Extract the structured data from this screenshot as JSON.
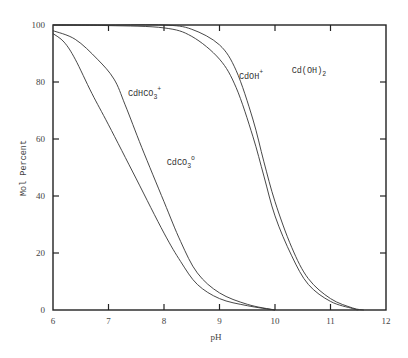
{
  "chart_data": {
    "type": "line",
    "title": "",
    "xlabel": "pH",
    "ylabel": "Mol Percent",
    "xlim": [
      6,
      12
    ],
    "ylim": [
      0,
      100
    ],
    "x_ticks": [
      "6",
      "7",
      "8",
      "9",
      "10",
      "11",
      "12"
    ],
    "y_ticks": [
      "0",
      "20",
      "40",
      "60",
      "80",
      "100"
    ],
    "grid": false,
    "series": [
      {
        "name": "CdCO3 boundary (lower)",
        "points": [
          [
            6.0,
            97
          ],
          [
            6.2,
            94
          ],
          [
            6.4,
            88
          ],
          [
            6.7,
            76
          ],
          [
            7.0,
            65
          ],
          [
            7.5,
            46
          ],
          [
            8.0,
            27
          ],
          [
            8.3,
            17
          ],
          [
            8.6,
            9
          ],
          [
            9.0,
            4
          ],
          [
            9.5,
            1.5
          ],
          [
            10.0,
            0
          ]
        ]
      },
      {
        "name": "CdHCO3+ boundary",
        "points": [
          [
            6.0,
            98
          ],
          [
            6.4,
            95
          ],
          [
            6.8,
            88
          ],
          [
            7.1,
            81
          ],
          [
            7.3,
            72
          ],
          [
            7.6,
            57
          ],
          [
            8.0,
            38
          ],
          [
            8.3,
            24
          ],
          [
            8.6,
            13
          ],
          [
            9.0,
            6
          ],
          [
            9.5,
            2
          ],
          [
            10.0,
            0
          ]
        ]
      },
      {
        "name": "CdOH+ boundary",
        "points": [
          [
            6.0,
            100
          ],
          [
            7.0,
            99.8
          ],
          [
            8.0,
            99
          ],
          [
            8.5,
            96
          ],
          [
            9.0,
            88
          ],
          [
            9.3,
            78
          ],
          [
            9.6,
            61
          ],
          [
            9.8,
            47
          ],
          [
            10.0,
            33
          ],
          [
            10.3,
            19
          ],
          [
            10.6,
            9
          ],
          [
            11.0,
            3
          ],
          [
            11.4,
            0.5
          ],
          [
            11.5,
            0
          ]
        ]
      },
      {
        "name": "Cd(OH)2 boundary",
        "points": [
          [
            6.0,
            100
          ],
          [
            7.0,
            100
          ],
          [
            8.0,
            100
          ],
          [
            8.5,
            98.5
          ],
          [
            9.0,
            93
          ],
          [
            9.3,
            84
          ],
          [
            9.6,
            67
          ],
          [
            9.8,
            52
          ],
          [
            10.0,
            38
          ],
          [
            10.3,
            22
          ],
          [
            10.6,
            11
          ],
          [
            11.0,
            4
          ],
          [
            11.4,
            0.7
          ],
          [
            11.6,
            0
          ]
        ]
      }
    ],
    "annotations": [
      {
        "text": "CdHCO",
        "sub": "3",
        "sup": "+",
        "at": [
          7.35,
          75
        ]
      },
      {
        "text": "CdCO",
        "sub": "3",
        "sup": "o",
        "at": [
          8.05,
          51
        ]
      },
      {
        "text": "CdOH",
        "sub": "",
        "sup": "+",
        "at": [
          9.35,
          81
        ]
      },
      {
        "text": "Cd(OH)",
        "sub": "2",
        "sup": "",
        "at": [
          10.3,
          83
        ]
      }
    ]
  }
}
